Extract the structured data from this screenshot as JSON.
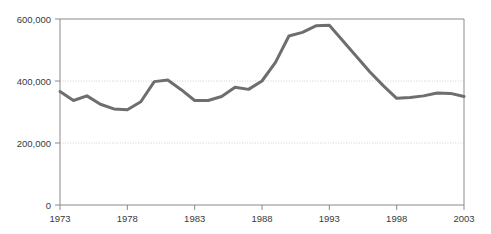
{
  "chart_data": {
    "type": "line",
    "title": "",
    "subtitle": "",
    "xlabel": "",
    "ylabel": "",
    "xlim": [
      1973,
      2003
    ],
    "ylim": [
      0,
      600000
    ],
    "grid": true,
    "gridlines_y": [
      200000,
      400000
    ],
    "legend": null,
    "legend_position": "none",
    "x_tick_labels": [
      "1973",
      "1978",
      "1983",
      "1988",
      "1993",
      "1998",
      "2003"
    ],
    "x_ticks": [
      1973,
      1978,
      1983,
      1988,
      1993,
      1998,
      2003
    ],
    "y_tick_labels": [
      "0",
      "200,000",
      "400,000",
      "600,000"
    ],
    "y_ticks": [
      0,
      200000,
      400000,
      600000
    ],
    "x": [
      1973,
      1974,
      1975,
      1976,
      1977,
      1978,
      1979,
      1980,
      1981,
      1982,
      1983,
      1984,
      1985,
      1986,
      1987,
      1988,
      1989,
      1990,
      1991,
      1992,
      1993,
      1994,
      1995,
      1996,
      1997,
      1998,
      1999,
      2000,
      2001,
      2002,
      2003
    ],
    "values": [
      366000,
      337000,
      352000,
      325000,
      310000,
      307000,
      333000,
      398000,
      403000,
      372000,
      337000,
      337000,
      350000,
      380000,
      373000,
      400000,
      460000,
      545000,
      557000,
      578000,
      580000,
      530000,
      480000,
      430000,
      385000,
      344000,
      347000,
      352000,
      361000,
      360000,
      350000
    ],
    "line_color": "#6e6e6e",
    "line_width": 3,
    "axis_color": "#8a8a8a",
    "grid_color": "#cfcfcf",
    "background_color": "#ffffff",
    "text_color": "#3a3a3a"
  },
  "axes": {
    "plot_left": 60,
    "plot_right": 464,
    "plot_top": 19,
    "plot_bottom": 205
  }
}
